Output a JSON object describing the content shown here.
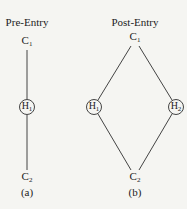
{
  "diagram": {
    "panels": [
      {
        "title": "Pre-Entry",
        "caption": "(a)",
        "nodes": [
          {
            "id": "C1",
            "letter": "C",
            "sub": "1",
            "circled": false
          },
          {
            "id": "H1",
            "letter": "H",
            "sub": "1",
            "circled": true
          },
          {
            "id": "C2",
            "letter": "C",
            "sub": "2",
            "circled": false
          }
        ],
        "edges": [
          [
            "C1",
            "H1"
          ],
          [
            "H1",
            "C2"
          ]
        ]
      },
      {
        "title": "Post-Entry",
        "caption": "(b)",
        "nodes": [
          {
            "id": "C1",
            "letter": "C",
            "sub": "1",
            "circled": false
          },
          {
            "id": "H1",
            "letter": "H",
            "sub": "1",
            "circled": true
          },
          {
            "id": "H2",
            "letter": "H",
            "sub": "2",
            "circled": true
          },
          {
            "id": "C2",
            "letter": "C",
            "sub": "2",
            "circled": false
          }
        ],
        "edges": [
          [
            "C1",
            "H1"
          ],
          [
            "C1",
            "H2"
          ],
          [
            "H1",
            "C2"
          ],
          [
            "H2",
            "C2"
          ]
        ]
      }
    ],
    "colors": {
      "line": "#444444",
      "background": "#f5f5f2"
    }
  }
}
